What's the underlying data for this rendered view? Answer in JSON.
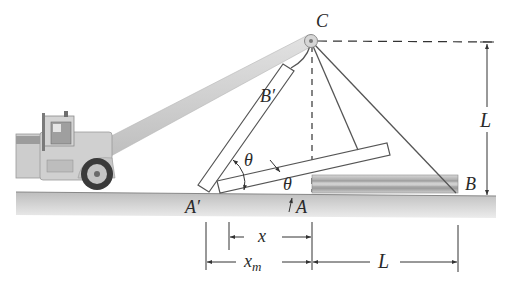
{
  "figure": {
    "labels": {
      "pulley": "C",
      "beam_top_raised": "B′",
      "beam_base_raised": "A′",
      "beam_base": "A",
      "beam_top": "B",
      "angle_upper": "θ",
      "angle_lower": "θ",
      "height": "L",
      "dim_x": "x",
      "dim_xm_base": "x",
      "dim_xm_sub": "m",
      "dim_L": "L"
    },
    "colors": {
      "ground_top": "#c9c9c9",
      "ground_bottom": "#e8e8e8",
      "line": "#4a4a4a",
      "boom": "#cfcfcf",
      "truck": "#c8c8c8"
    }
  }
}
